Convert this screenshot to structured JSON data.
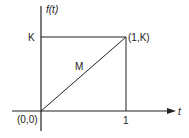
{
  "diagram": {
    "y_axis_label": "f(t)",
    "x_axis_label": "t",
    "k_label": "K",
    "point_label": "(1,K)",
    "diagonal_label": "M",
    "origin_label": "(0,0)",
    "x_tick_label": "1",
    "line_color": "#222222"
  }
}
